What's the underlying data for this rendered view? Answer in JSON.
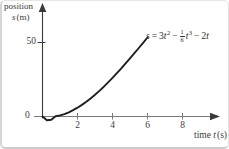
{
  "colors": {
    "curve": "#1f1f1f",
    "axis": "#7a7a7a",
    "arrow": "#3a3a3a",
    "text": "#3c3c3c",
    "background": "#ffffff"
  },
  "labels": {
    "position_word": "position",
    "s_var": "s",
    "s_unit": "(m)",
    "y_tick_50": "50",
    "origin": "0",
    "x_ticks": [
      "2",
      "4",
      "6",
      "8"
    ],
    "time_word": "time",
    "t_var": "t",
    "t_unit": "(s)"
  },
  "equation": {
    "lhs": "s",
    "equals": "=",
    "coeff1": "3",
    "t_var": "t",
    "exp2": "2",
    "minus": "−",
    "frac_num": "1",
    "frac_den": "6",
    "exp3": "3",
    "coeff3": "2"
  },
  "chart_data": {
    "type": "line",
    "title": "",
    "xlabel": "time t (s)",
    "ylabel": "position s (m)",
    "equation": "s = 3t^2 - (1/6)t^3 - 2t",
    "t_range": [
      0,
      6
    ],
    "xlim": [
      0,
      9.6
    ],
    "ylim": [
      -2,
      65
    ],
    "x_axis_ticks": [
      2,
      4,
      6,
      8
    ],
    "y_axis_ticks": [
      50
    ],
    "grid": false,
    "t": [
      0,
      0.25,
      0.5,
      0.75,
      1,
      1.25,
      1.5,
      1.75,
      2,
      2.25,
      2.5,
      2.75,
      3,
      3.25,
      3.5,
      3.75,
      4,
      4.25,
      4.5,
      4.75,
      5,
      5.25,
      5.5,
      5.75,
      6
    ],
    "s": [
      0,
      -0.32,
      -0.27,
      0.12,
      0.83,
      1.86,
      3.19,
      4.79,
      6.67,
      8.79,
      11.15,
      13.72,
      16.5,
      19.46,
      22.6,
      25.9,
      29.33,
      32.89,
      36.56,
      40.32,
      44.17,
      48.08,
      52.02,
      55.99,
      60
    ]
  }
}
